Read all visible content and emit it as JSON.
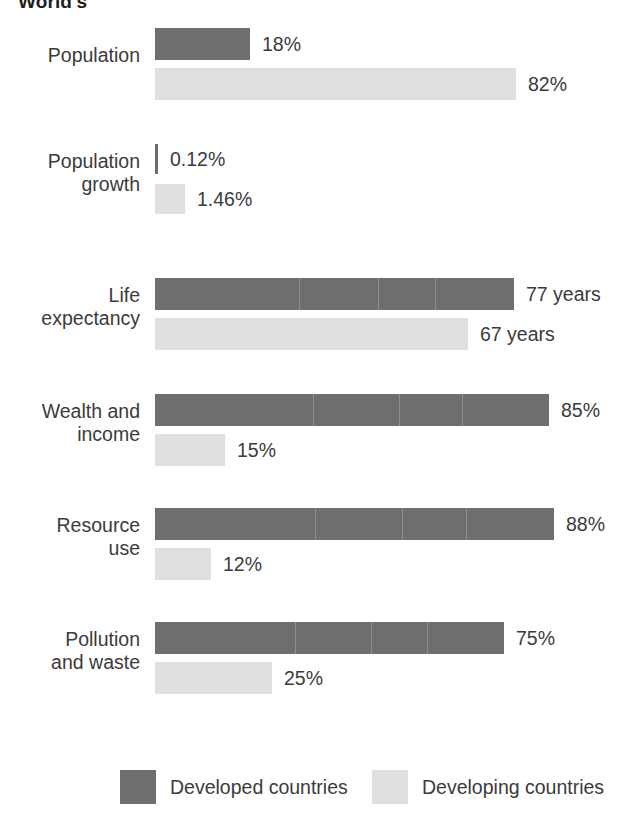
{
  "chart_data": {
    "type": "bar",
    "title": "World's",
    "orientation": "horizontal",
    "grid": false,
    "legend_position": "bottom",
    "categories": [
      "Population",
      "Population\ngrowth",
      "Life\nexpectancy",
      "Wealth and\nincome",
      "Resource\nuse",
      "Pollution\nand waste"
    ],
    "series": [
      {
        "name": "Developed countries",
        "color": "#6e6e6e",
        "values": [
          18,
          0.12,
          77,
          85,
          88,
          75
        ],
        "labels": [
          "18%",
          "0.12%",
          "77 years",
          "85%",
          "88%",
          "75%"
        ]
      },
      {
        "name": "Developing countries",
        "color": "#e0e0e0",
        "values": [
          82,
          1.46,
          67,
          15,
          12,
          25
        ],
        "labels": [
          "82%",
          "1.46%",
          "67 years",
          "15%",
          "12%",
          "25%"
        ]
      }
    ],
    "rows": [
      {
        "category": "Population",
        "developed": {
          "label": "18%",
          "value": 18,
          "bar_px": 95
        },
        "developing": {
          "label": "82%",
          "value": 82,
          "bar_px": 361
        }
      },
      {
        "category": "Population\ngrowth",
        "developed": {
          "label": "0.12%",
          "value": 0.12,
          "bar_px": 3
        },
        "developing": {
          "label": "1.46%",
          "value": 1.46,
          "bar_px": 30
        }
      },
      {
        "category": "Life\nexpectancy",
        "developed": {
          "label": "77 years",
          "value": 77,
          "bar_px": 359
        },
        "developing": {
          "label": "67 years",
          "value": 67,
          "bar_px": 313
        }
      },
      {
        "category": "Wealth and\nincome",
        "developed": {
          "label": "85%",
          "value": 85,
          "bar_px": 394
        },
        "developing": {
          "label": "15%",
          "value": 15,
          "bar_px": 70
        }
      },
      {
        "category": "Resource\nuse",
        "developed": {
          "label": "88%",
          "value": 88,
          "bar_px": 399
        },
        "developing": {
          "label": "12%",
          "value": 12,
          "bar_px": 56
        }
      },
      {
        "category": "Pollution\nand waste",
        "developed": {
          "label": "75%",
          "value": 75,
          "bar_px": 349
        },
        "developing": {
          "label": "25%",
          "value": 25,
          "bar_px": 117
        }
      }
    ],
    "legend": [
      {
        "label": "Developed countries",
        "color": "#6e6e6e"
      },
      {
        "label": "Developing countries",
        "color": "#e0e0e0"
      }
    ]
  },
  "colors": {
    "developed": "#6e6e6e",
    "developing": "#e0e0e0",
    "text": "#3b3b3b",
    "title": "#1d1d1d",
    "background": "#ffffff"
  }
}
